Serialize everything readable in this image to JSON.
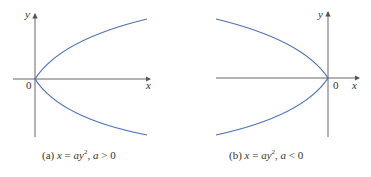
{
  "figures": [
    {
      "id": "a",
      "caption_tag": "(a)",
      "equation_lhs": "x",
      "equation_rhs": "ay",
      "exponent": "2",
      "condition_var": "a",
      "condition": "> 0",
      "axis_labels": {
        "x": "x",
        "y": "y",
        "origin": "0"
      }
    },
    {
      "id": "b",
      "caption_tag": "(b)",
      "equation_lhs": "x",
      "equation_rhs": "ay",
      "exponent": "2",
      "condition_var": "a",
      "condition": "< 0",
      "axis_labels": {
        "x": "x",
        "y": "y",
        "origin": "0"
      }
    }
  ],
  "colors": {
    "curve": "#4a6fb5",
    "axis": "#555555"
  }
}
